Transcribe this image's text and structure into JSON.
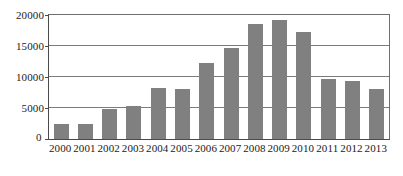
{
  "chart_data": {
    "type": "bar",
    "title": "",
    "subtitle": "",
    "xlabel": "",
    "ylabel": "",
    "categories": [
      "2000",
      "2001",
      "2002",
      "2003",
      "2004",
      "2005",
      "2006",
      "2007",
      "2008",
      "2009",
      "2010",
      "2011",
      "2012",
      "2013"
    ],
    "values": [
      2500,
      2400,
      4900,
      5400,
      8200,
      8100,
      12300,
      14600,
      18500,
      19200,
      17300,
      9700,
      9300,
      8000
    ],
    "series": [
      {
        "name": "",
        "values": [
          2500,
          2400,
          4900,
          5400,
          8200,
          8100,
          12300,
          14600,
          18500,
          19200,
          17300,
          9700,
          9300,
          8000
        ]
      }
    ],
    "ylim": [
      0,
      20000
    ],
    "yticks": [
      0,
      5000,
      10000,
      15000,
      20000
    ],
    "ytick_labels": [
      "0",
      "5000",
      "10000",
      "15000",
      "20000"
    ],
    "grid": true,
    "grid_axis": "y",
    "legend": false,
    "legend_position": "none",
    "bar_color": "#808080",
    "axis_color": "#4a4a4a",
    "gridline_color": "#7b7b7b",
    "background_color": "#ffffff",
    "annotations": []
  }
}
